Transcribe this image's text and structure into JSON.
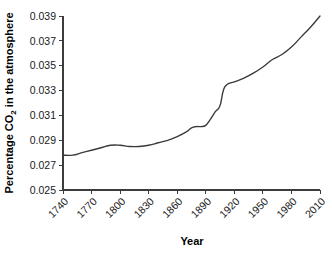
{
  "chart_data": {
    "type": "line",
    "title": "",
    "xlabel": "Year",
    "ylabel": "Percentage CO2 in the atmosphere",
    "ylabel_prefix": "Percentage CO",
    "ylabel_sub": "2",
    "ylabel_suffix": " in the atmosphere",
    "xlim": [
      1740,
      2010
    ],
    "ylim": [
      0.025,
      0.039
    ],
    "grid": false,
    "legend": null,
    "xtick_labels": [
      "1740",
      "1770",
      "1800",
      "1830",
      "1860",
      "1890",
      "1920",
      "1950",
      "1980",
      "2010"
    ],
    "xtick_values": [
      1740,
      1770,
      1800,
      1830,
      1860,
      1890,
      1920,
      1950,
      1980,
      2010
    ],
    "ytick_labels": [
      "0.025",
      "0.027",
      "0.029",
      "0.031",
      "0.033",
      "0.035",
      "0.037",
      "0.039"
    ],
    "ytick_values": [
      0.025,
      0.027,
      0.029,
      0.031,
      0.033,
      0.035,
      0.037,
      0.039
    ],
    "series": [
      {
        "name": "Atmospheric CO2",
        "color": "#3a3a3a",
        "x": [
          1740,
          1750,
          1760,
          1770,
          1780,
          1790,
          1800,
          1810,
          1820,
          1830,
          1840,
          1850,
          1860,
          1870,
          1875,
          1880,
          1885,
          1890,
          1895,
          1900,
          1905,
          1910,
          1920,
          1930,
          1940,
          1950,
          1960,
          1970,
          1980,
          1990,
          2000,
          2010
        ],
        "values": [
          0.0278,
          0.0278,
          0.028,
          0.0282,
          0.0284,
          0.0286,
          0.0286,
          0.0285,
          0.0285,
          0.0286,
          0.0288,
          0.029,
          0.0293,
          0.0297,
          0.03,
          0.0301,
          0.0301,
          0.0302,
          0.0307,
          0.0313,
          0.0318,
          0.0333,
          0.0337,
          0.034,
          0.0344,
          0.0349,
          0.0355,
          0.0359,
          0.0365,
          0.0373,
          0.0381,
          0.039
        ]
      }
    ]
  },
  "axes_geometry": {
    "plot_left": 63,
    "plot_right": 320,
    "plot_top": 16,
    "plot_bottom": 190
  }
}
